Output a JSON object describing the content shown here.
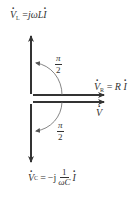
{
  "diagram": {
    "type": "phasor",
    "colors": {
      "arrow": "#333333",
      "arc": "#666666",
      "text": "#333333"
    },
    "labels": {
      "vl": {
        "symbol": "V",
        "sub": "L",
        "eq": "=",
        "rhs_pre": "jωL",
        "rhs_var": "I"
      },
      "vr": {
        "symbol": "V",
        "sub": "R",
        "eq": "=",
        "rhs_pre": "R",
        "rhs_var": "I"
      },
      "v": {
        "symbol": "V"
      },
      "vc": {
        "symbol": "V",
        "sub": "C",
        "eq": "=",
        "rhs_pre": "−j",
        "frac_num": "1",
        "frac_den": "ωC",
        "rhs_var": "I"
      }
    },
    "angles": {
      "upper": {
        "num": "π",
        "den": "2"
      },
      "lower": {
        "num": "π",
        "den": "2"
      }
    }
  }
}
